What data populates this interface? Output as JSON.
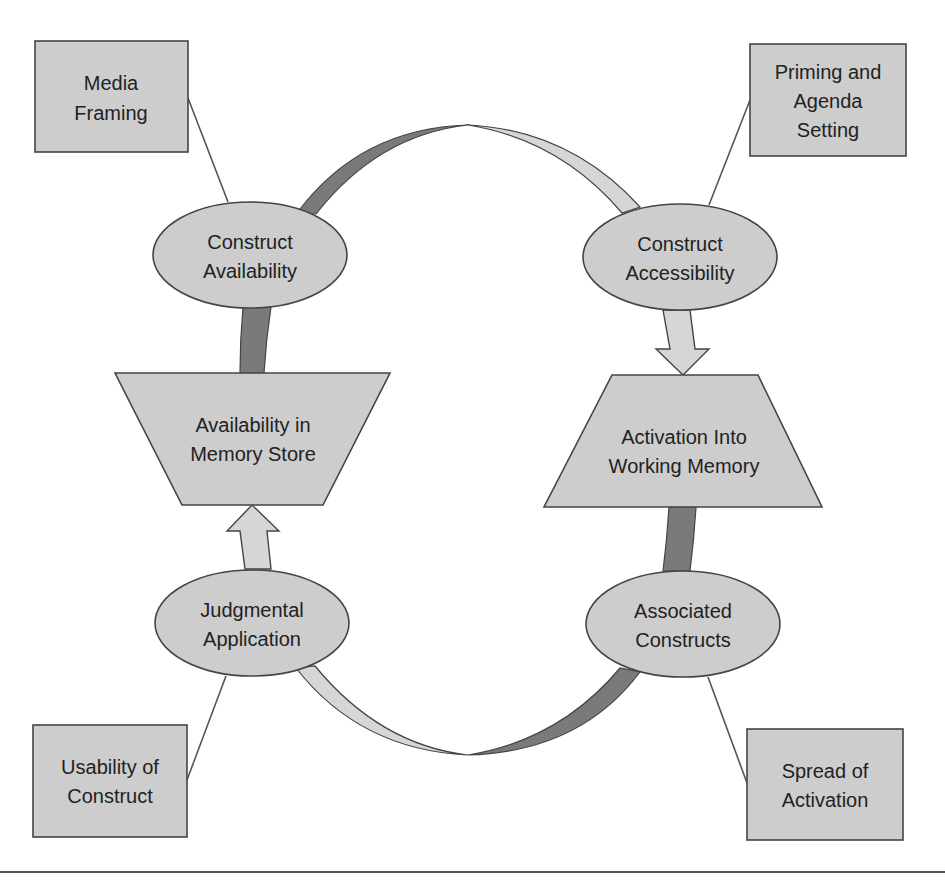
{
  "diagram": {
    "colors": {
      "shape_fill": "#cdcdcd",
      "shape_stroke": "#444444",
      "dark_band": "#7a7a7a",
      "light_band": "#d6d6d6",
      "connector": "#555555",
      "text": "#222222",
      "background": "#ffffff"
    },
    "boxes": {
      "media_framing": {
        "line1": "Media",
        "line2": "Framing"
      },
      "priming": {
        "line1": "Priming and",
        "line2": "Agenda",
        "line3": "Setting"
      },
      "usability": {
        "line1": "Usability of",
        "line2": "Construct"
      },
      "spread": {
        "line1": "Spread of",
        "line2": "Activation"
      }
    },
    "ellipses": {
      "construct_availability": {
        "line1": "Construct",
        "line2": "Availability"
      },
      "construct_accessibility": {
        "line1": "Construct",
        "line2": "Accessibility"
      },
      "judgmental_application": {
        "line1": "Judgmental",
        "line2": "Application"
      },
      "associated_constructs": {
        "line1": "Associated",
        "line2": "Constructs"
      }
    },
    "trapezoids": {
      "availability_memory": {
        "line1": "Availability in",
        "line2": "Memory Store"
      },
      "activation_working": {
        "line1": "Activation Into",
        "line2": "Working Memory"
      }
    }
  }
}
